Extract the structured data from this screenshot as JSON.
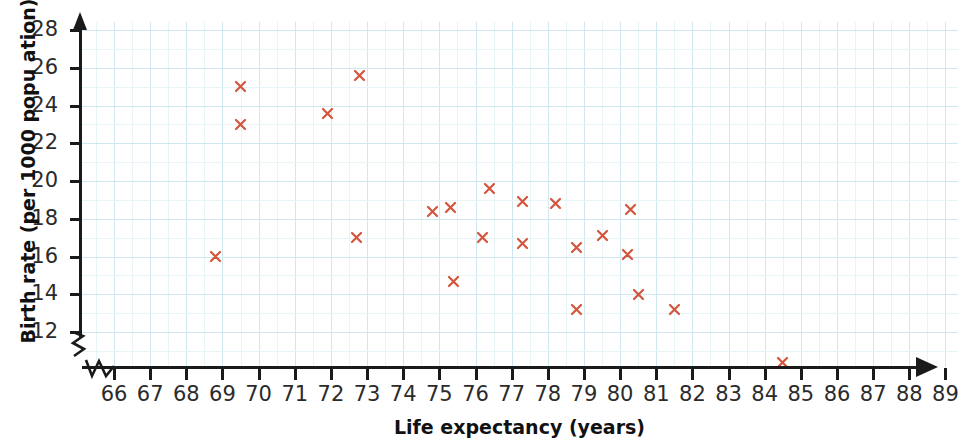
{
  "chart_data": {
    "type": "scatter",
    "title": "",
    "xlabel": "Life expectancy (years)",
    "ylabel": "Birth rate (per 1000 popu ation)",
    "xlim": [
      65.2,
      89
    ],
    "ylim": [
      9.6,
      28
    ],
    "x_ticks": [
      66,
      67,
      68,
      69,
      70,
      71,
      72,
      73,
      74,
      75,
      76,
      77,
      78,
      79,
      80,
      81,
      82,
      83,
      84,
      85,
      86,
      87,
      88,
      89
    ],
    "y_ticks": [
      12,
      14,
      16,
      18,
      20,
      22,
      24,
      26,
      28
    ],
    "x_axis_broken": true,
    "y_axis_broken": true,
    "grid": true,
    "grid_color": "#cfe8f0",
    "marker": "x",
    "marker_color": "#d4553c",
    "legend": "none",
    "points": [
      {
        "x": 68.8,
        "y": 16.0
      },
      {
        "x": 69.5,
        "y": 25.0
      },
      {
        "x": 69.5,
        "y": 23.0
      },
      {
        "x": 71.9,
        "y": 23.6
      },
      {
        "x": 72.8,
        "y": 25.6
      },
      {
        "x": 72.7,
        "y": 17.0
      },
      {
        "x": 74.8,
        "y": 18.4
      },
      {
        "x": 75.3,
        "y": 18.6
      },
      {
        "x": 75.4,
        "y": 14.7
      },
      {
        "x": 76.4,
        "y": 19.6
      },
      {
        "x": 76.2,
        "y": 17.0
      },
      {
        "x": 77.3,
        "y": 18.9
      },
      {
        "x": 77.3,
        "y": 16.7
      },
      {
        "x": 78.2,
        "y": 18.8
      },
      {
        "x": 78.8,
        "y": 16.5
      },
      {
        "x": 78.8,
        "y": 13.2
      },
      {
        "x": 79.5,
        "y": 17.1
      },
      {
        "x": 80.3,
        "y": 18.5
      },
      {
        "x": 80.2,
        "y": 16.1
      },
      {
        "x": 80.5,
        "y": 14.0
      },
      {
        "x": 81.5,
        "y": 13.2
      },
      {
        "x": 84.5,
        "y": 10.4
      }
    ]
  },
  "axis": {
    "y_title": "Birth rate (per 1000 popu ation)",
    "x_title": "Life expectancy (years)"
  }
}
